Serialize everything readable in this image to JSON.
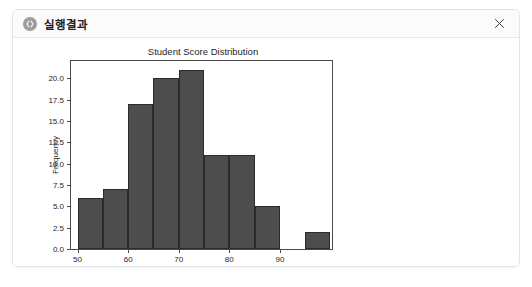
{
  "window": {
    "title": "실행결과",
    "app_icon": "code-icon",
    "close_label": "✕"
  },
  "chart_data": {
    "type": "bar",
    "title": "Student Score Distribution",
    "xlabel": "Score",
    "ylabel": "Frequency",
    "bin_edges": [
      50,
      55,
      60,
      65,
      70,
      75,
      80,
      85,
      90,
      95,
      100
    ],
    "categories": [
      "50-55",
      "55-60",
      "60-65",
      "65-70",
      "70-75",
      "75-80",
      "80-85",
      "85-90",
      "90-95",
      "95-100"
    ],
    "values": [
      6,
      7,
      17,
      20,
      21,
      11,
      11,
      5,
      0,
      2
    ],
    "xlim": [
      48.7,
      100.3
    ],
    "ylim": [
      0,
      22.05
    ],
    "xticks": [
      50,
      60,
      70,
      80,
      90
    ],
    "xticklabels": [
      "50",
      "60",
      "70",
      "80",
      "90"
    ],
    "yticks": [
      0.0,
      2.5,
      5.0,
      7.5,
      10.0,
      12.5,
      15.0,
      17.5,
      20.0
    ],
    "yticklabels": [
      "0.0",
      "2.5",
      "5.0",
      "7.5",
      "10.0",
      "12.5",
      "15.0",
      "17.5",
      "20.0"
    ],
    "grid": false,
    "legend": null,
    "bar_color": "#4d4d4d",
    "bar_edge_color": "#2b2b2b"
  }
}
